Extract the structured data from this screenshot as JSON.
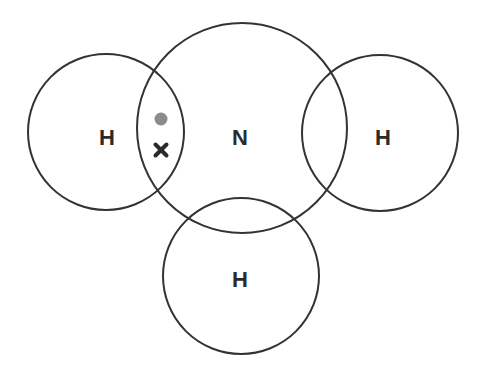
{
  "diagram": {
    "colors": {
      "shell_stroke": "#333333",
      "label": "#2b2b2b",
      "dot_electron": "#8c8c8c",
      "cross_electron": "#2b2b2b",
      "background": "#ffffff"
    },
    "atoms": [
      {
        "id": "h-left",
        "label": "H",
        "cx": 106,
        "cy": 132,
        "r": 78
      },
      {
        "id": "n-center",
        "label": "N",
        "cx": 242,
        "cy": 128,
        "r": 105
      },
      {
        "id": "h-right",
        "label": "H",
        "cx": 380,
        "cy": 133,
        "r": 78
      },
      {
        "id": "h-bottom",
        "label": "H",
        "cx": 241,
        "cy": 276,
        "r": 78
      }
    ],
    "electrons": [
      {
        "type": "dot",
        "owner": "H",
        "x": 161,
        "y": 119
      },
      {
        "type": "cross",
        "owner": "N",
        "x": 161,
        "y": 150
      }
    ]
  }
}
